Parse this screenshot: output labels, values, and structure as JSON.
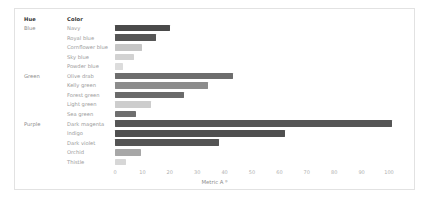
{
  "panel": {
    "columns": {
      "hue_header": "Hue",
      "color_header": "Color"
    }
  },
  "chart_data": {
    "type": "bar",
    "orientation": "horizontal",
    "title": "",
    "xlabel": "Metric A ᴮ",
    "ylabel": "Color",
    "xlim": [
      0,
      105
    ],
    "xticks": [
      0,
      10,
      20,
      30,
      40,
      50,
      60,
      70,
      80,
      90,
      100
    ],
    "xtick_labels": [
      "0",
      "10",
      "20",
      "30",
      "40",
      "50",
      "60",
      "70",
      "80",
      "90",
      "100"
    ],
    "grid": false,
    "legend": "none",
    "groups": [
      {
        "hue": "Blue",
        "rows": [
          {
            "color": "Navy",
            "value": 20.0,
            "bar_color": "#4a4a4a"
          },
          {
            "color": "Royal blue",
            "value": 15.0,
            "bar_color": "#565656"
          },
          {
            "color": "Cornflower blue",
            "value": 10.0,
            "bar_color": "#c6c6c6"
          },
          {
            "color": "Sky blue",
            "value": 7.0,
            "bar_color": "#d2d2d2"
          },
          {
            "color": "Powder blue",
            "value": 3.0,
            "bar_color": "#dcdcdc"
          }
        ]
      },
      {
        "hue": "Green",
        "rows": [
          {
            "color": "Olive drab",
            "value": 43.0,
            "bar_color": "#6d6d6d"
          },
          {
            "color": "Kelly green",
            "value": 34.0,
            "bar_color": "#8c8c8c"
          },
          {
            "color": "Forest green",
            "value": 25.0,
            "bar_color": "#6a6a6a"
          },
          {
            "color": "Light green",
            "value": 13.0,
            "bar_color": "#cdcdcd"
          },
          {
            "color": "Sea green",
            "value": 7.5,
            "bar_color": "#6e6e6e"
          }
        ]
      },
      {
        "hue": "Purple",
        "rows": [
          {
            "color": "Dark magenta",
            "value": 101.0,
            "bar_color": "#555555"
          },
          {
            "color": "Indigo",
            "value": 62.0,
            "bar_color": "#4f4f4f"
          },
          {
            "color": "Dark violet",
            "value": 38.0,
            "bar_color": "#545454"
          },
          {
            "color": "Orchid",
            "value": 9.5,
            "bar_color": "#a7a7a7"
          },
          {
            "color": "Thistle",
            "value": 4.0,
            "bar_color": "#d7d7d7"
          }
        ]
      }
    ]
  }
}
